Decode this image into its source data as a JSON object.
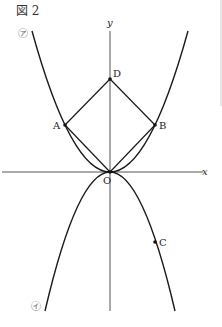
{
  "figure": {
    "title": "図 2",
    "axes": {
      "x_label": "x",
      "y_label": "y",
      "origin_label": "O"
    },
    "curves": [
      {
        "id": "upper",
        "label": "㋐",
        "description": "upward parabola through O, A, B"
      },
      {
        "id": "lower",
        "label": "㋑",
        "description": "downward parabola through O, C"
      }
    ],
    "points": [
      {
        "name": "D",
        "px": [
          110,
          79
        ]
      },
      {
        "name": "A",
        "px": [
          65,
          125
        ]
      },
      {
        "name": "B",
        "px": [
          155,
          125
        ]
      },
      {
        "name": "O",
        "px": [
          110,
          172
        ]
      },
      {
        "name": "C",
        "px": [
          155,
          242
        ]
      }
    ],
    "segments": [
      "AD",
      "DB",
      "AO",
      "BO"
    ],
    "colors": {
      "line": "#1a1a1a",
      "axis": "#555555",
      "label_circle": "#666666"
    }
  }
}
